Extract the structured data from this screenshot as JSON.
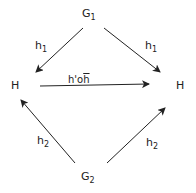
{
  "diagram": {
    "nodes": {
      "top": {
        "base": "G",
        "sub": "1"
      },
      "bottom": {
        "base": "G",
        "sub": "2"
      },
      "left": {
        "label": "H"
      },
      "right": {
        "label": "H"
      }
    },
    "edges": {
      "top_left": {
        "base": "h",
        "sub": "1"
      },
      "top_right": {
        "base": "h",
        "sub": "1"
      },
      "bottom_left": {
        "base": "h",
        "sub": "2"
      },
      "bottom_right": {
        "base": "h",
        "sub": "2"
      },
      "horizontal": {
        "prefix": "h'",
        "op": "o",
        "suffix": "h"
      }
    }
  }
}
